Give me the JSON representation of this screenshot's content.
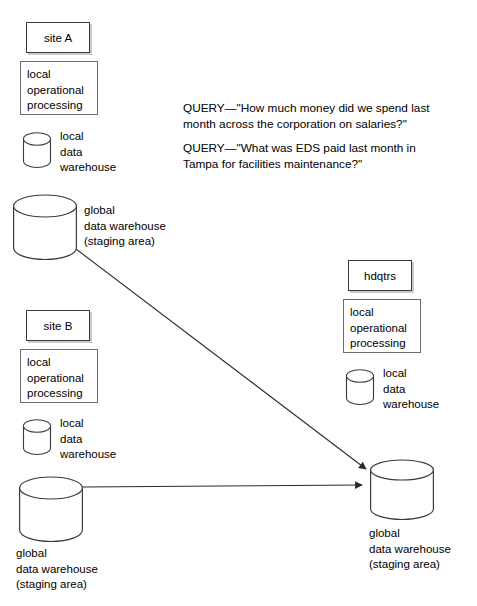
{
  "diagram": {
    "queries": [
      "QUERY—\"How much money did we spend last month across the corporation on salaries?\"",
      "QUERY—\"What was EDS paid last month in Tampa for facilities maintenance?\""
    ],
    "sites": {
      "site_a": {
        "header": "site A",
        "processing": [
          "local",
          "operational",
          "processing"
        ],
        "local_warehouse": [
          "local",
          "data",
          "warehouse"
        ],
        "global_warehouse": [
          "global",
          "data warehouse",
          "(staging area)"
        ]
      },
      "site_b": {
        "header": "site B",
        "processing": [
          "local",
          "operational",
          "processing"
        ],
        "local_warehouse": [
          "local",
          "data",
          "warehouse"
        ],
        "global_warehouse": [
          "global",
          "data warehouse",
          "(staging area)"
        ]
      },
      "hdqtrs": {
        "header": "hdqtrs",
        "processing": [
          "local",
          "operational",
          "processing"
        ],
        "local_warehouse": [
          "local",
          "data",
          "warehouse"
        ],
        "global_warehouse": [
          "global",
          "data warehouse",
          "(staging area)"
        ]
      }
    },
    "colors": {
      "line": "#3a3a3a",
      "box_border": "#6e6e6e",
      "shadow": "#c9c9c9",
      "background": "#ffffff"
    }
  }
}
